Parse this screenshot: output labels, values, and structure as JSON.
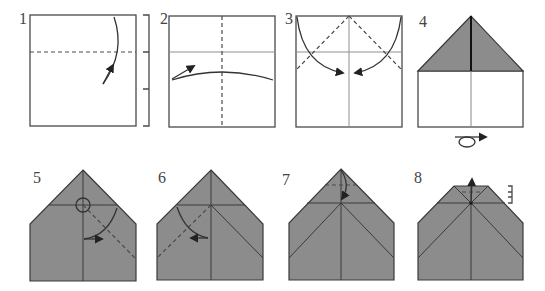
{
  "diagram": {
    "steps": [
      {
        "label": "1",
        "instruction_icons": [
          "valley-fold-line",
          "fold-arrow",
          "proportion-bracket"
        ]
      },
      {
        "label": "2",
        "instruction_icons": [
          "valley-fold-line",
          "fold-arrow",
          "crease-line"
        ]
      },
      {
        "label": "3",
        "instruction_icons": [
          "valley-fold-line",
          "fold-arrow",
          "crease-line"
        ]
      },
      {
        "label": "4",
        "instruction_icons": [
          "turn-over-symbol"
        ]
      },
      {
        "label": "5",
        "instruction_icons": [
          "reference-point-circle",
          "valley-fold-line",
          "fold-arrow"
        ]
      },
      {
        "label": "6",
        "instruction_icons": [
          "valley-fold-line",
          "fold-arrow"
        ]
      },
      {
        "label": "7",
        "instruction_icons": [
          "valley-fold-line",
          "fold-arrow"
        ]
      },
      {
        "label": "8",
        "instruction_icons": [
          "unfold-arrow",
          "valley-fold-line",
          "proportion-bracket"
        ]
      }
    ]
  },
  "colors": {
    "paper_front": "#ffffff",
    "paper_back": "#8c8c8c",
    "outline": "#4a4a4a",
    "crease": "#8f8f8f"
  }
}
